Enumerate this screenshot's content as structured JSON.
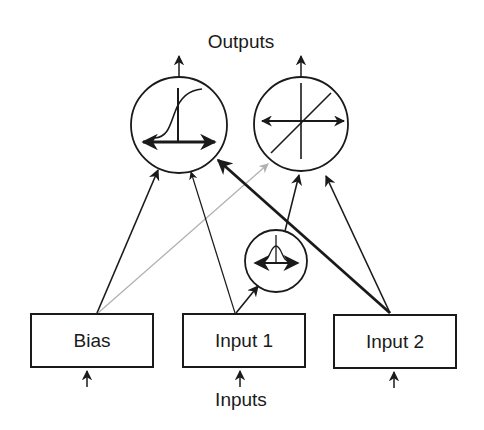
{
  "diagram": {
    "title_top": "Outputs",
    "title_bottom": "Inputs",
    "nodes": {
      "bias": {
        "label": "Bias",
        "type": "input"
      },
      "input1": {
        "label": "Input 1",
        "type": "input"
      },
      "input2": {
        "label": "Input 2",
        "type": "input"
      },
      "sigmoid_unit": {
        "label": "",
        "type": "output",
        "activation": "sigmoid-icon"
      },
      "linear_unit": {
        "label": "",
        "type": "output",
        "activation": "linear-icon"
      },
      "gaussian_unit": {
        "label": "",
        "type": "hidden",
        "activation": "gaussian-icon"
      }
    },
    "edges": [
      {
        "from": "bias",
        "to": "sigmoid_unit",
        "style": "normal"
      },
      {
        "from": "bias",
        "to": "linear_unit",
        "style": "gray"
      },
      {
        "from": "input1",
        "to": "sigmoid_unit",
        "style": "thin"
      },
      {
        "from": "input1",
        "to": "gaussian_unit",
        "style": "normal"
      },
      {
        "from": "gaussian_unit",
        "to": "linear_unit",
        "style": "normal"
      },
      {
        "from": "input2",
        "to": "sigmoid_unit",
        "style": "thick"
      },
      {
        "from": "input2",
        "to": "linear_unit",
        "style": "normal"
      }
    ],
    "colors": {
      "line": "#1a1a1a",
      "gray_line": "#b0b0b0",
      "background": "#ffffff"
    }
  }
}
